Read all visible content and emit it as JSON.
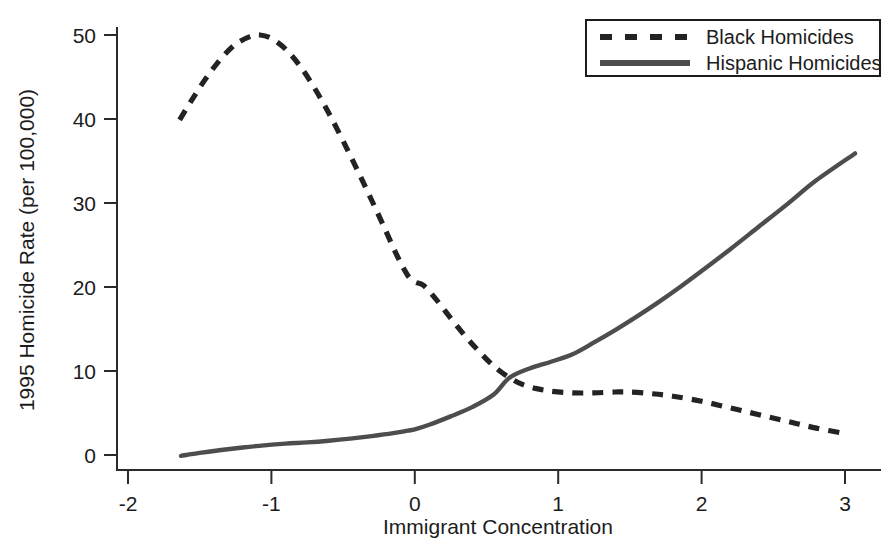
{
  "chart_data": {
    "type": "line",
    "title": "",
    "xlabel": "Immigrant Concentration",
    "ylabel": "1995 Homicide Rate (per 100,000)",
    "xlim": [
      -2.15,
      3.3
    ],
    "ylim": [
      -1.5,
      53
    ],
    "xticks": [
      -2,
      -1,
      0,
      1,
      2,
      3
    ],
    "xticklabels": [
      "-2",
      "-1",
      "0",
      "1",
      "2",
      "3"
    ],
    "yticks": [
      0,
      10,
      20,
      30,
      40,
      50
    ],
    "yticklabels": [
      "0",
      "10",
      "20",
      "30",
      "40",
      "50"
    ],
    "grid": false,
    "legend_position": "top-right",
    "series": [
      {
        "name": "Black Homicides",
        "style": "dashed",
        "color": "#232323",
        "x": [
          -1.64,
          -1.55,
          -1.45,
          -1.35,
          -1.25,
          -1.15,
          -1.08,
          -1.0,
          -0.9,
          -0.8,
          -0.7,
          -0.6,
          -0.5,
          -0.4,
          -0.3,
          -0.2,
          -0.12,
          -0.05,
          0.0,
          0.06,
          0.15,
          0.25,
          0.35,
          0.45,
          0.55,
          0.66,
          0.75,
          0.85,
          0.95,
          1.1,
          1.25,
          1.4,
          1.5,
          1.65,
          1.8,
          2.0,
          2.2,
          2.4,
          2.6,
          2.8,
          3.02
        ],
        "y": [
          39.9,
          42.4,
          45.0,
          47.2,
          48.9,
          49.8,
          50.0,
          49.6,
          48.3,
          46.3,
          43.7,
          40.7,
          37.4,
          33.9,
          30.3,
          26.6,
          23.6,
          21.4,
          20.6,
          20.2,
          18.5,
          16.3,
          14.2,
          12.3,
          10.6,
          9.2,
          8.4,
          7.9,
          7.6,
          7.4,
          7.4,
          7.5,
          7.5,
          7.3,
          7.0,
          6.4,
          5.6,
          4.8,
          4.0,
          3.2,
          2.5
        ]
      },
      {
        "name": "Hispanic Homicides",
        "style": "solid",
        "color": "#4d4d4d",
        "x": [
          -1.63,
          -1.5,
          -1.35,
          -1.2,
          -1.05,
          -0.9,
          -0.75,
          -0.6,
          -0.45,
          -0.3,
          -0.15,
          -0.05,
          0.0,
          0.1,
          0.25,
          0.4,
          0.55,
          0.66,
          0.8,
          0.95,
          1.1,
          1.25,
          1.4,
          1.55,
          1.7,
          1.85,
          2.0,
          2.2,
          2.4,
          2.6,
          2.8,
          3.07
        ],
        "y": [
          -0.1,
          0.25,
          0.6,
          0.9,
          1.15,
          1.35,
          1.5,
          1.7,
          1.95,
          2.25,
          2.6,
          2.9,
          3.05,
          3.6,
          4.6,
          5.7,
          7.2,
          9.2,
          10.3,
          11.1,
          12.0,
          13.4,
          14.9,
          16.5,
          18.2,
          20.0,
          21.9,
          24.5,
          27.2,
          29.9,
          32.7,
          35.9
        ]
      }
    ],
    "legend": [
      {
        "label": "Black Homicides",
        "style": "dashed"
      },
      {
        "label": "Hispanic Homicides",
        "style": "solid"
      }
    ]
  }
}
